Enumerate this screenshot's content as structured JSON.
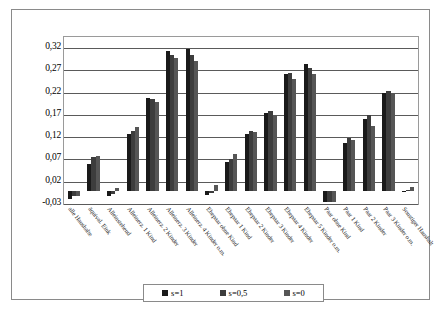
{
  "chart_data": {
    "type": "bar",
    "title": "",
    "xlabel": "",
    "ylabel": "",
    "ylim": [
      -0.03,
      0.345
    ],
    "yticks": [
      -0.03,
      0.02,
      0.07,
      0.12,
      0.17,
      0.22,
      0.27,
      0.32
    ],
    "ytick_labels": [
      "-0,03",
      "0,02",
      "0,07",
      "0,12",
      "0,17",
      "0,22",
      "0,27",
      "0,32"
    ],
    "grid": true,
    "legend_position": "bottom",
    "categories": [
      "alle Haushalte",
      "äquival. Eink",
      "Alleinstehend",
      "Alleinerz. 1 Kind",
      "Alleinerz. 2 Kinder",
      "Alleinerz. 3 Kinder",
      "Alleinerz. 4 Kinder o.m.",
      "Ehepaar ohne Kind",
      "Ehepaar 1 Kind",
      "Ehepaar 2 Kinder",
      "Ehepaar 3 Kinder",
      "Ehepaar 4 Kinder",
      "Ehepaar 5 Kinder o.m.",
      "Paar ohne Kind",
      "Paar 1 Kind",
      "Paar 2 Kinder",
      "Paar 3 Kinder o.m.",
      "Sonstiger Haushalt"
    ],
    "series": [
      {
        "name": "s=1",
        "color": "#1a1a1a",
        "values": [
          -0.018,
          0.06,
          -0.012,
          0.128,
          0.209,
          0.313,
          0.317,
          -0.01,
          0.064,
          0.128,
          0.175,
          0.262,
          0.285,
          -0.026,
          0.108,
          0.161,
          0.22,
          -0.004
        ]
      },
      {
        "name": "s=0,5",
        "color": "#3d3d3d",
        "values": [
          -0.012,
          0.076,
          -0.008,
          0.133,
          0.206,
          0.305,
          0.305,
          -0.005,
          0.072,
          0.135,
          0.179,
          0.265,
          0.275,
          -0.026,
          0.118,
          0.169,
          0.224,
          0.002
        ]
      },
      {
        "name": "s=0",
        "color": "#565656",
        "values": [
          -0.012,
          0.078,
          0.006,
          0.142,
          0.198,
          0.297,
          0.291,
          0.012,
          0.082,
          0.132,
          0.17,
          0.25,
          0.261,
          -0.026,
          0.114,
          0.145,
          0.219,
          0.008
        ]
      }
    ]
  },
  "legend": {
    "entries": [
      {
        "label": "s=1"
      },
      {
        "label": "s=0,5"
      },
      {
        "label": "s=0"
      }
    ]
  }
}
